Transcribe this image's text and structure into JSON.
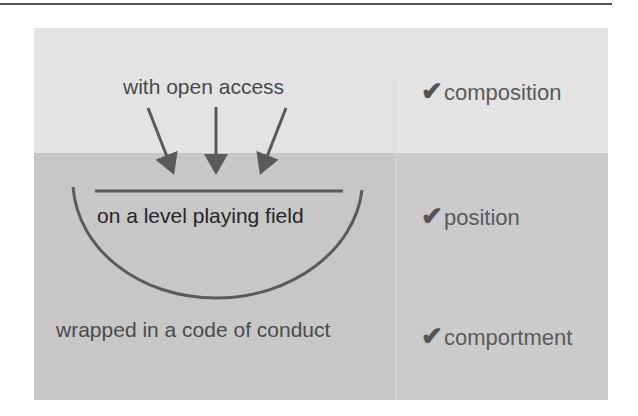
{
  "diagram": {
    "left": {
      "top_label": "with open access",
      "middle_label": "on a level playing field",
      "bottom_label": "wrapped in a code of conduct"
    },
    "right": {
      "checks": [
        {
          "icon": "checkmark-icon",
          "glyph": "✔",
          "label": "composition"
        },
        {
          "icon": "checkmark-icon",
          "glyph": "✔",
          "label": "position"
        },
        {
          "icon": "checkmark-icon",
          "glyph": "✔",
          "label": "comportment"
        }
      ]
    },
    "colors": {
      "top_band": "#e3e3e3",
      "lower_bands": "#c7c7c7",
      "stroke": "#5a5a5a"
    }
  }
}
